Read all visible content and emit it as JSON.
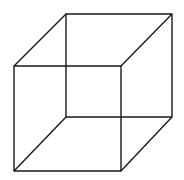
{
  "diagram": {
    "type": "necker-cube",
    "stroke_color": "#1a1a1a",
    "background": "#ffffff",
    "front_face": {
      "x1": 14,
      "y1": 66,
      "x2": 121,
      "y2": 171
    },
    "back_face": {
      "x1": 66,
      "y1": 14,
      "x2": 172,
      "y2": 117
    }
  }
}
